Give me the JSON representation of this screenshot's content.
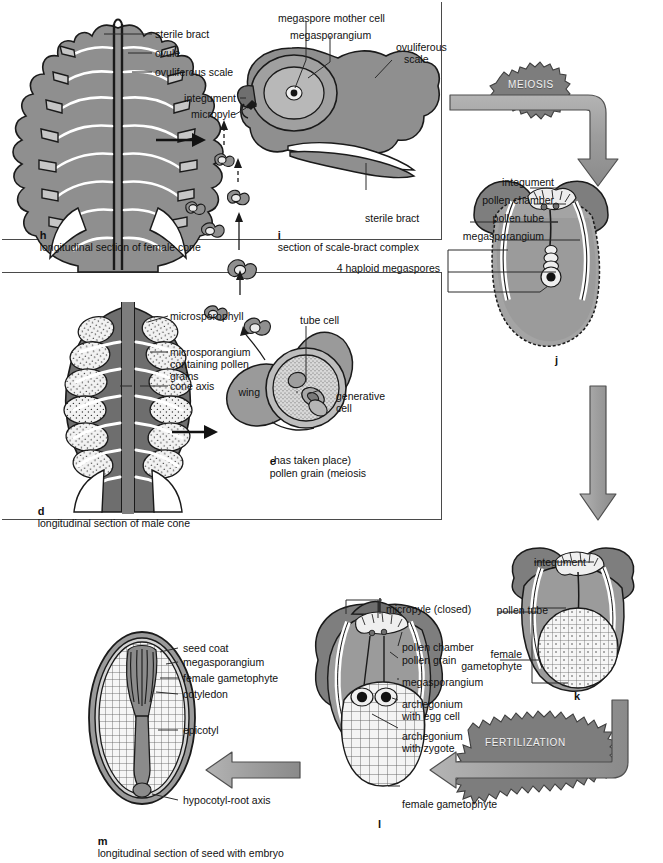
{
  "figure": {
    "palette": {
      "tissue_mid": "#8f8f8f",
      "tissue_dark": "#6e6e6e",
      "tissue_light": "#c9c9c9",
      "tissue_pale": "#e4e4e4",
      "outline": "#1f1f1f",
      "arrow_fill": "#9a9a9a",
      "arrow_stroke": "#4f4f4f",
      "burst_fill": "#7d7d7d",
      "panel_border": "#4a4a4a",
      "leader": "#2b2b2b",
      "text": "#111111"
    }
  },
  "panels": {
    "female_cone": {
      "plate": "h",
      "caption": "longitudinal section of female cone",
      "labels": [
        "sterile bract",
        "ovule",
        "ovuliferous scale"
      ]
    },
    "scale_bract": {
      "plate": "i",
      "caption": "section of scale-bract complex",
      "labels_top": [
        "megaspore mother cell",
        "megasporangium"
      ],
      "labels_right": [
        "ovuliferous",
        "scale"
      ],
      "label_bottom": "sterile bract",
      "labels_left": [
        "integument",
        "micropyle"
      ]
    },
    "male_cone": {
      "plate": "d",
      "caption": "longitudinal section of male cone",
      "labels": [
        "microsporophyll",
        "microsporangium",
        "containing pollen",
        "grains",
        "cone axis"
      ]
    },
    "pollen_grain": {
      "plate": "e",
      "caption_line1": "pollen grain (meiosis",
      "caption_line2": "has taken place)",
      "labels": [
        "tube cell",
        "wing",
        "generative",
        "cell"
      ]
    },
    "ovule_meiosis": {
      "plate": "j",
      "labels": [
        "integument",
        "pollen chamber",
        "pollen tube",
        "megasporangium",
        "4 haploid megaspores"
      ]
    },
    "gametophyte": {
      "plate": "k",
      "labels": [
        "integument",
        "pollen tube",
        "female",
        "gametophyte"
      ]
    },
    "fertilized_ovule": {
      "plate": "l",
      "labels": [
        "micropyle (closed)",
        "pollen chamber",
        "pollen grain",
        "megasporangium",
        "archegonium",
        "with egg cell",
        "archegonium",
        "with zygote",
        "female gametophyte"
      ]
    },
    "seed": {
      "plate": "m",
      "caption": "longitudinal section of seed with embryo",
      "labels": [
        "seed coat",
        "megasporangium",
        "female gametophyte",
        "cotyledon",
        "epicotyl",
        "hypocotyl-root axis"
      ]
    }
  },
  "process_badges": [
    {
      "name": "meiosis-badge",
      "text": "MEIOSIS"
    },
    {
      "name": "fertilization-badge",
      "text": "FERTILIZATION"
    }
  ]
}
